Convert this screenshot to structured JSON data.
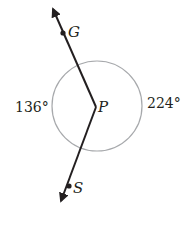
{
  "diagram": {
    "type": "geometry-angle",
    "points": {
      "G": {
        "label": "G"
      },
      "P": {
        "label": "P"
      },
      "S": {
        "label": "S"
      }
    },
    "angles": {
      "left": {
        "label": "136°",
        "value": 136
      },
      "right": {
        "label": "224°",
        "value": 224
      }
    },
    "colors": {
      "line": "#231f20",
      "circle": "#a7a9ac",
      "text": "#231f20"
    }
  }
}
